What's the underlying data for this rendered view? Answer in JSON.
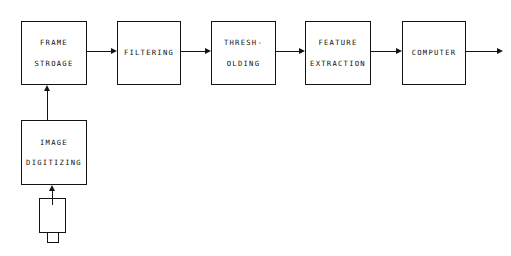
{
  "diagram": {
    "stroke_color": "#141414",
    "background_color": "#ffffff",
    "nodes": [
      {
        "id": "frame-storage",
        "line1": "FRAME",
        "line2": "STROAGE"
      },
      {
        "id": "filtering",
        "line1": "FILTERING",
        "line2": ""
      },
      {
        "id": "thresholding",
        "line1": "THRESH-",
        "line2": "OLDING"
      },
      {
        "id": "feature-extraction",
        "line1": "FEATURE",
        "line2": "EXTRACTION"
      },
      {
        "id": "computer",
        "line1": "COMPUTER",
        "line2": ""
      },
      {
        "id": "image-digitizing",
        "line1": "IMAGE",
        "line2": "DIGITIZING"
      }
    ],
    "camera": {
      "id": "camera",
      "label": "camera"
    },
    "connectors": [
      {
        "id": "frame-storage-to-filtering",
        "direction": "right"
      },
      {
        "id": "filtering-to-thresholding",
        "direction": "right"
      },
      {
        "id": "thresholding-to-feature-extraction",
        "direction": "right"
      },
      {
        "id": "feature-extraction-to-computer",
        "direction": "right"
      },
      {
        "id": "computer-output",
        "direction": "right"
      },
      {
        "id": "image-digitizing-to-frame-storage",
        "direction": "up"
      },
      {
        "id": "camera-to-image-digitizing",
        "direction": "up"
      }
    ]
  }
}
